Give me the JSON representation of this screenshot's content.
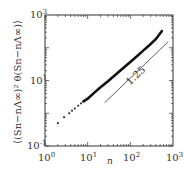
{
  "chart_data": {
    "type": "scatter",
    "title": "",
    "xlabel": "n",
    "ylabel": "⟨(S_n − nΛ^∞)² θ(S_n − nΛ^∞)⟩",
    "xscale": "log",
    "yscale": "log",
    "xlim": [
      1,
      1000
    ],
    "ylim": [
      0.1,
      1000
    ],
    "x_ticks": [
      "10^0",
      "10^1",
      "10^2",
      "10^3"
    ],
    "y_ticks": [
      "10^-1",
      "10^1",
      "10^3"
    ],
    "grid": false,
    "series": [
      {
        "name": "data",
        "x": [
          2,
          2.8,
          3.7,
          4.3,
          5,
          6,
          7,
          8,
          10,
          15,
          20,
          30,
          50,
          80,
          100,
          150,
          200,
          300,
          400,
          550
        ],
        "y": [
          0.5,
          0.76,
          1.0,
          1.2,
          1.4,
          1.7,
          2.0,
          2.3,
          2.8,
          4.5,
          6.2,
          9.5,
          17,
          29,
          37,
          58,
          82,
          130,
          185,
          324
        ]
      }
    ],
    "annotations": [
      {
        "type": "reference_line",
        "slope": 1.25,
        "label": "1.25",
        "x_range": [
          25,
          770
        ]
      }
    ]
  },
  "axes": {
    "x_label": "n",
    "x_ticks": [
      {
        "base": "10",
        "exp": "0"
      },
      {
        "base": "10",
        "exp": "1"
      },
      {
        "base": "10",
        "exp": "2"
      },
      {
        "base": "10",
        "exp": "3"
      }
    ],
    "y_ticks": [
      {
        "base": "10",
        "exp": "-1"
      },
      {
        "base": "10",
        "exp": "1"
      },
      {
        "base": "10",
        "exp": "3"
      }
    ],
    "y_label": "⟨(Sn−nΛ∞)² θ(Sn−nΛ∞)⟩",
    "slope_label": "1.25"
  }
}
